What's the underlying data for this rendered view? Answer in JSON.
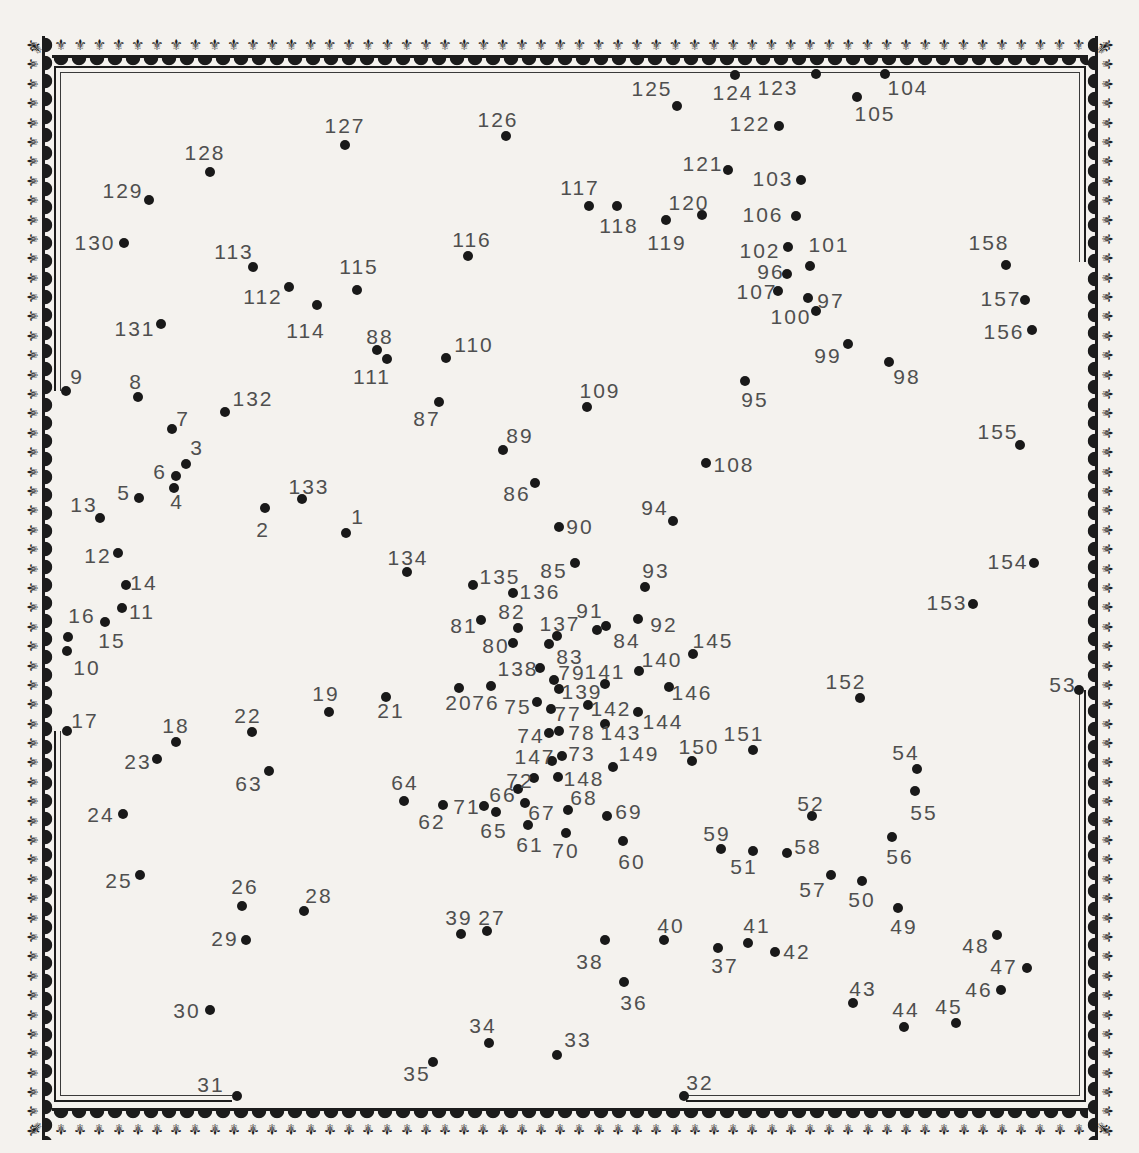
{
  "palette": {
    "paper": "#f4f2ee",
    "ink": "#1c1c1c",
    "label_gray": "#4f4f4f",
    "dot_black": "#191919"
  },
  "border": {
    "motif": "fleur-de-lis-icon",
    "glyph": "⚜"
  },
  "puzzle": {
    "dot_count": 158,
    "first_number": 1,
    "last_number": 158,
    "frame": {
      "outer": {
        "color": "#1d1d1d",
        "segs": [
          [
            54,
            66,
            1032,
            2
          ],
          [
            54,
            66,
            2,
            325
          ],
          [
            54,
            731,
            2,
            371
          ],
          [
            1084,
            66,
            2,
            196
          ],
          [
            1084,
            690,
            2,
            412
          ],
          [
            54,
            1100,
            178,
            2
          ],
          [
            686,
            1100,
            400,
            2
          ]
        ]
      },
      "inner": {
        "color": "#3a3a3a",
        "segs": [
          [
            60,
            72,
            1020,
            1
          ],
          [
            60,
            72,
            1,
            319
          ],
          [
            60,
            731,
            1,
            365
          ],
          [
            1079,
            72,
            1,
            190
          ],
          [
            1079,
            690,
            1,
            406
          ],
          [
            60,
            1095,
            172,
            1
          ],
          [
            686,
            1095,
            393,
            1
          ]
        ]
      }
    },
    "points": [
      [
        1,
        346,
        533,
        358,
        517
      ],
      [
        2,
        265,
        508,
        263,
        530
      ],
      [
        3,
        186,
        464,
        197,
        448
      ],
      [
        4,
        174,
        488,
        177,
        502
      ],
      [
        5,
        139,
        498,
        124,
        493
      ],
      [
        6,
        176,
        476,
        160,
        472
      ],
      [
        7,
        172,
        429,
        183,
        419
      ],
      [
        8,
        138,
        397,
        136,
        382
      ],
      [
        9,
        66,
        391,
        77,
        377
      ],
      [
        10,
        67,
        651,
        87,
        668
      ],
      [
        11,
        122,
        608,
        142,
        612
      ],
      [
        12,
        118,
        553,
        98,
        556
      ],
      [
        13,
        100,
        518,
        84,
        505
      ],
      [
        14,
        126,
        585,
        144,
        583
      ],
      [
        15,
        68,
        637,
        112,
        641
      ],
      [
        16,
        105,
        622,
        82,
        616
      ],
      [
        17,
        67,
        731,
        85,
        721
      ],
      [
        18,
        176,
        742,
        176,
        726
      ],
      [
        19,
        329,
        712,
        326,
        694
      ],
      [
        20,
        459,
        688,
        459,
        703
      ],
      [
        21,
        386,
        697,
        391,
        711
      ],
      [
        22,
        252,
        732,
        248,
        716
      ],
      [
        23,
        157,
        759,
        138,
        762
      ],
      [
        24,
        123,
        814,
        101,
        815
      ],
      [
        25,
        140,
        875,
        119,
        881
      ],
      [
        26,
        242,
        906,
        245,
        887
      ],
      [
        27,
        487,
        931,
        492,
        918
      ],
      [
        28,
        304,
        911,
        319,
        896
      ],
      [
        29,
        246,
        940,
        225,
        939
      ],
      [
        30,
        210,
        1010,
        187,
        1011
      ],
      [
        31,
        237,
        1096,
        211,
        1085
      ],
      [
        32,
        684,
        1096,
        700,
        1083
      ],
      [
        33,
        557,
        1055,
        578,
        1040
      ],
      [
        34,
        489,
        1043,
        483,
        1026
      ],
      [
        35,
        433,
        1062,
        417,
        1074
      ],
      [
        36,
        624,
        982,
        634,
        1003
      ],
      [
        37,
        718,
        948,
        725,
        966
      ],
      [
        38,
        605,
        940,
        590,
        962
      ],
      [
        39,
        461,
        934,
        459,
        918
      ],
      [
        40,
        664,
        940,
        671,
        926
      ],
      [
        41,
        748,
        943,
        757,
        926
      ],
      [
        42,
        775,
        952,
        797,
        952
      ],
      [
        43,
        853,
        1003,
        863,
        989
      ],
      [
        44,
        904,
        1027,
        906,
        1010
      ],
      [
        45,
        956,
        1023,
        949,
        1007
      ],
      [
        46,
        1001,
        990,
        979,
        990
      ],
      [
        47,
        1027,
        968,
        1004,
        967
      ],
      [
        48,
        997,
        935,
        976,
        946
      ],
      [
        49,
        898,
        908,
        904,
        927
      ],
      [
        50,
        862,
        881,
        862,
        900
      ],
      [
        51,
        753,
        851,
        744,
        867
      ],
      [
        52,
        812,
        816,
        811,
        804
      ],
      [
        53,
        1079,
        690,
        1063,
        685
      ],
      [
        54,
        917,
        769,
        906,
        753
      ],
      [
        55,
        915,
        791,
        924,
        813
      ],
      [
        56,
        892,
        837,
        900,
        857
      ],
      [
        57,
        831,
        875,
        813,
        890
      ],
      [
        58,
        787,
        853,
        808,
        847
      ],
      [
        59,
        721,
        849,
        717,
        834
      ],
      [
        60,
        623,
        841,
        632,
        862
      ],
      [
        61,
        528,
        825,
        530,
        845
      ],
      [
        62,
        443,
        805,
        432,
        822
      ],
      [
        63,
        269,
        771,
        249,
        784
      ],
      [
        64,
        404,
        801,
        405,
        783
      ],
      [
        65,
        496,
        812,
        494,
        831
      ],
      [
        66,
        518,
        789,
        503,
        795
      ],
      [
        67,
        525,
        803,
        542,
        813
      ],
      [
        68,
        568,
        810,
        584,
        798
      ],
      [
        69,
        607,
        816,
        629,
        812
      ],
      [
        70,
        566,
        833,
        566,
        851
      ],
      [
        71,
        484,
        806,
        467,
        807
      ],
      [
        72,
        534,
        778,
        520,
        781
      ],
      [
        73,
        562,
        756,
        582,
        754
      ],
      [
        74,
        549,
        733,
        531,
        736
      ],
      [
        75,
        537,
        702,
        518,
        707
      ],
      [
        76,
        491,
        686,
        486,
        703
      ],
      [
        77,
        551,
        709,
        568,
        714
      ],
      [
        78,
        559,
        731,
        582,
        733
      ],
      [
        79,
        554,
        680,
        572,
        673
      ],
      [
        80,
        513,
        643,
        496,
        646
      ],
      [
        81,
        481,
        620,
        464,
        626
      ],
      [
        82,
        518,
        628,
        512,
        612
      ],
      [
        83,
        549,
        644,
        570,
        657
      ],
      [
        84,
        606,
        626,
        627,
        641
      ],
      [
        85,
        575,
        563,
        554,
        571
      ],
      [
        86,
        535,
        483,
        517,
        494
      ],
      [
        87,
        439,
        402,
        427,
        419
      ],
      [
        88,
        377,
        350,
        380,
        337
      ],
      [
        89,
        503,
        450,
        520,
        436
      ],
      [
        90,
        559,
        527,
        580,
        527
      ],
      [
        91,
        597,
        630,
        590,
        611
      ],
      [
        92,
        638,
        619,
        664,
        625
      ],
      [
        93,
        645,
        587,
        656,
        571
      ],
      [
        94,
        673,
        521,
        655,
        508
      ],
      [
        95,
        745,
        381,
        755,
        400
      ],
      [
        96,
        787,
        274,
        771,
        272
      ],
      [
        97,
        808,
        298,
        831,
        301
      ],
      [
        98,
        889,
        362,
        907,
        377
      ],
      [
        99,
        848,
        344,
        828,
        356
      ],
      [
        100,
        816,
        311,
        791,
        317
      ],
      [
        101,
        810,
        266,
        829,
        245
      ],
      [
        102,
        788,
        247,
        760,
        251
      ],
      [
        103,
        801,
        180,
        773,
        179
      ],
      [
        104,
        885,
        74,
        908,
        88
      ],
      [
        105,
        857,
        97,
        875,
        114
      ],
      [
        106,
        796,
        216,
        763,
        215
      ],
      [
        107,
        778,
        291,
        757,
        292
      ],
      [
        108,
        706,
        463,
        734,
        465
      ],
      [
        109,
        587,
        407,
        600,
        391
      ],
      [
        110,
        446,
        358,
        474,
        345
      ],
      [
        111,
        387,
        359,
        372,
        377
      ],
      [
        112,
        289,
        287,
        263,
        297
      ],
      [
        113,
        253,
        267,
        234,
        252
      ],
      [
        114,
        317,
        305,
        306,
        331
      ],
      [
        115,
        357,
        290,
        359,
        267
      ],
      [
        116,
        468,
        256,
        472,
        240
      ],
      [
        117,
        589,
        206,
        580,
        188
      ],
      [
        118,
        617,
        206,
        619,
        226
      ],
      [
        119,
        666,
        220,
        667,
        243
      ],
      [
        120,
        702,
        215,
        689,
        203
      ],
      [
        121,
        728,
        170,
        703,
        164
      ],
      [
        122,
        779,
        126,
        750,
        124
      ],
      [
        123,
        816,
        74,
        778,
        88
      ],
      [
        124,
        735,
        75,
        733,
        93
      ],
      [
        125,
        677,
        106,
        652,
        89
      ],
      [
        126,
        506,
        136,
        498,
        120
      ],
      [
        127,
        345,
        145,
        345,
        126
      ],
      [
        128,
        210,
        172,
        205,
        153
      ],
      [
        129,
        149,
        200,
        123,
        191
      ],
      [
        130,
        124,
        243,
        95,
        243
      ],
      [
        131,
        161,
        324,
        135,
        329
      ],
      [
        132,
        225,
        412,
        253,
        399
      ],
      [
        133,
        302,
        499,
        309,
        487
      ],
      [
        134,
        407,
        572,
        408,
        558
      ],
      [
        135,
        473,
        585,
        500,
        577
      ],
      [
        136,
        513,
        593,
        540,
        592
      ],
      [
        137,
        557,
        636,
        560,
        624
      ],
      [
        138,
        540,
        668,
        518,
        669
      ],
      [
        139,
        559,
        689,
        582,
        692
      ],
      [
        140,
        639,
        671,
        662,
        660
      ],
      [
        141,
        605,
        684,
        605,
        672
      ],
      [
        142,
        588,
        705,
        611,
        709
      ],
      [
        143,
        605,
        724,
        621,
        733
      ],
      [
        144,
        638,
        712,
        663,
        722
      ],
      [
        145,
        693,
        654,
        713,
        641
      ],
      [
        146,
        669,
        687,
        692,
        693
      ],
      [
        147,
        552,
        761,
        535,
        757
      ],
      [
        148,
        558,
        777,
        584,
        779
      ],
      [
        149,
        613,
        767,
        639,
        754
      ],
      [
        150,
        692,
        761,
        699,
        747
      ],
      [
        151,
        753,
        750,
        744,
        734
      ],
      [
        152,
        860,
        698,
        846,
        682
      ],
      [
        153,
        973,
        604,
        947,
        603
      ],
      [
        154,
        1034,
        563,
        1008,
        562
      ],
      [
        155,
        1020,
        445,
        998,
        432
      ],
      [
        156,
        1032,
        330,
        1004,
        332
      ],
      [
        157,
        1025,
        300,
        1001,
        299
      ],
      [
        158,
        1006,
        265,
        989,
        243
      ]
    ]
  }
}
